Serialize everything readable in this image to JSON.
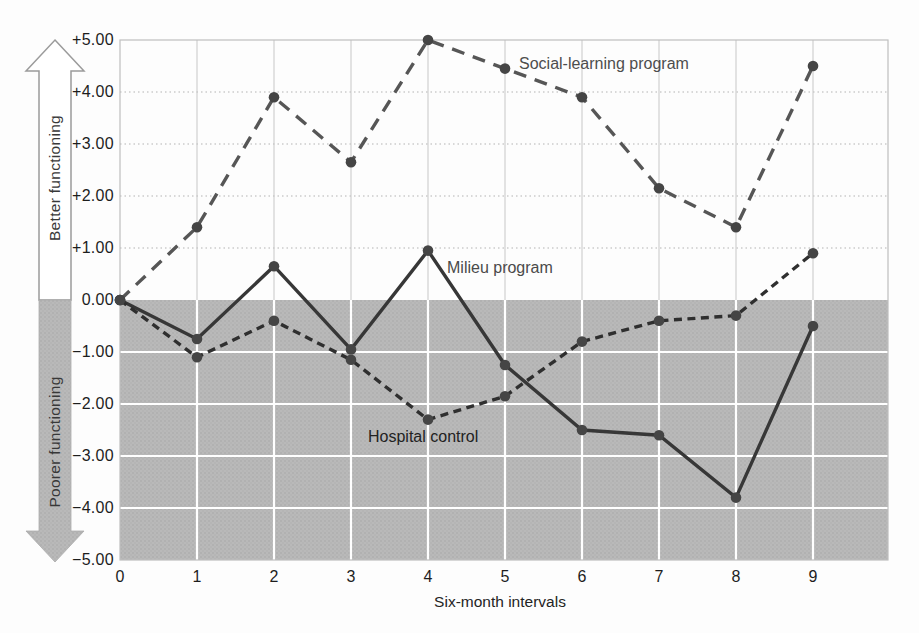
{
  "figure": {
    "colors": {
      "shade_gray": "#b9b9b9",
      "shade_dot": "#aeaeae",
      "grid_light": "#c7c7c7",
      "grid_dotted": "#b3b3b3",
      "grid_white": "#ffffff",
      "frame": "#bfbfbf",
      "arrow_outline": "#9b9b9b",
      "arrow_fill_top": "#ffffff",
      "arrow_fill_bottom": "#b9b9b9",
      "series_social": "#565656",
      "series_milieu": "#373737",
      "series_hospital": "#2f2f2f",
      "point_dot": "#454545",
      "text": "#1d1d1d"
    },
    "arrow_up_label": "Better functioning",
    "arrow_down_label": "Poorer functioning"
  },
  "chart_data": {
    "type": "line",
    "title": "",
    "xlabel": "Six-month intervals",
    "ylabel_up": "Better functioning",
    "ylabel_down": "Poorer functioning",
    "x": [
      0,
      1,
      2,
      3,
      4,
      5,
      6,
      7,
      8,
      9
    ],
    "x_tick_labels": [
      "0",
      "1",
      "2",
      "3",
      "4",
      "5",
      "6",
      "7",
      "8",
      "9"
    ],
    "y_ticks": [
      5,
      4,
      3,
      2,
      1,
      0,
      -1,
      -2,
      -3,
      -4,
      -5
    ],
    "y_tick_labels": [
      "+5.00",
      "+4.00",
      "+3.00",
      "+2.00",
      "+1.00",
      "0.00",
      "−1.00",
      "−2.00",
      "−3.00",
      "−4.00",
      "−5.00"
    ],
    "ylim": [
      -5,
      5
    ],
    "grid": true,
    "shaded_region": "below y=0 (poorer functioning) filled gray",
    "legend_position": "inline annotations next to each line",
    "series": [
      {
        "name": "Social-learning program",
        "style": "long-dash",
        "values": [
          0.0,
          1.4,
          3.9,
          2.65,
          5.0,
          4.45,
          3.9,
          2.15,
          1.4,
          4.5
        ]
      },
      {
        "name": "Milieu program",
        "style": "solid",
        "values": [
          0.0,
          -0.75,
          0.65,
          -0.95,
          0.95,
          -1.25,
          -2.5,
          -2.6,
          -3.8,
          -0.5
        ]
      },
      {
        "name": "Hospital control",
        "style": "short-dash",
        "values": [
          0.0,
          -1.1,
          -0.4,
          -1.15,
          -2.3,
          -1.85,
          -0.8,
          -0.4,
          -0.3,
          0.9
        ]
      }
    ]
  }
}
